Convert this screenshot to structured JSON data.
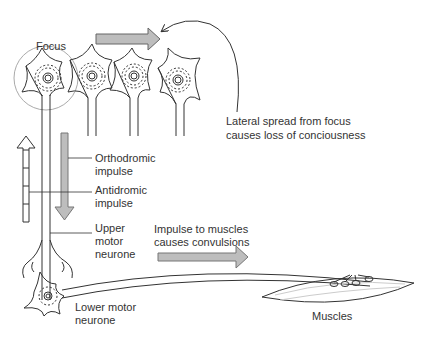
{
  "diagram": {
    "labels": {
      "focus": "Focus",
      "lateral_line1": "Lateral spread from focus",
      "lateral_line2": "causes loss of conciousness",
      "ortho_line1": "Orthodromic",
      "ortho_line2": "impulse",
      "anti_line1": "Antidromic",
      "anti_line2": "impulse",
      "upper_line1": "Upper",
      "upper_line2": "motor",
      "upper_line3": "neurone",
      "impulse_line1": "Impulse to muscles",
      "impulse_line2": "causes convulsions",
      "lower_line1": "Lower motor",
      "lower_line2": "neurone",
      "muscles": "Muscles"
    },
    "colors": {
      "line": "#333333",
      "arrow_fill": "#bdbdbd",
      "focus_circle": "#aaaaaa",
      "background": "#ffffff"
    },
    "icons": {
      "lateral_arrow": "right-arrow-icon",
      "orthodromic_arrow": "down-arrow-icon",
      "antidromic_arrow": "up-arrow-icon",
      "convulsion_arrow": "right-arrow-icon"
    }
  }
}
